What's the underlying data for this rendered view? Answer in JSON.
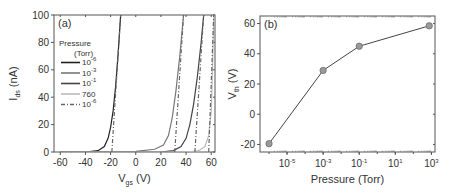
{
  "chart_data": [
    {
      "type": "line",
      "panel": "(a)",
      "xlabel": "V_gs (V)",
      "xlabel_main": "V",
      "xlabel_sub": "gs",
      "xlabel_unit": "(V)",
      "ylabel": "I_ds (nA)",
      "ylabel_main": "I",
      "ylabel_sub": "ds",
      "ylabel_unit": "(nA)",
      "xlim": [
        -65,
        63
      ],
      "ylim": [
        0,
        100
      ],
      "xticks": [
        "-60",
        "-40",
        "-20",
        "0",
        "20",
        "40",
        "60"
      ],
      "yticks": [
        "0",
        "20",
        "40",
        "60",
        "80",
        "100"
      ],
      "legend_title": [
        "Pressure",
        "(Torr)"
      ],
      "legend_position": "upper-left",
      "series": [
        {
          "name": "10^-6",
          "label_base": "10",
          "label_exp": "-6",
          "style": "solid",
          "color": "#222222",
          "x": [
            -60,
            -40,
            -30,
            -25,
            -22,
            -20,
            -18,
            -16,
            -14,
            -12
          ],
          "y": [
            0,
            0,
            1,
            4,
            10,
            18,
            30,
            48,
            72,
            100
          ]
        },
        {
          "name": "10^-3",
          "label_base": "10",
          "label_exp": "-3",
          "style": "solid",
          "color": "#777777",
          "x": [
            -60,
            0,
            15,
            22,
            26,
            29,
            32,
            35,
            38
          ],
          "y": [
            0,
            0.5,
            2,
            5,
            12,
            25,
            45,
            70,
            100
          ]
        },
        {
          "name": "10^-1",
          "label_base": "10",
          "label_exp": "-1",
          "style": "solid",
          "color": "#444444",
          "x": [
            -60,
            20,
            30,
            36,
            40,
            43,
            46,
            49,
            52,
            54
          ],
          "y": [
            0,
            0,
            1,
            4,
            10,
            20,
            35,
            55,
            80,
            100
          ]
        },
        {
          "name": "760",
          "label_base": "760",
          "label_exp": "",
          "style": "solid",
          "color": "#bbbbbb",
          "x": [
            -60,
            40,
            50,
            55,
            58,
            60,
            61,
            62
          ],
          "y": [
            0,
            0,
            1,
            4,
            12,
            30,
            60,
            100
          ]
        },
        {
          "name": "10^-6 (dashed fit)",
          "label_base": "10",
          "label_exp": "-6",
          "style": "dash-dot",
          "color": "#666666",
          "x": [
            -19,
            -12
          ],
          "y": [
            0,
            100
          ],
          "extra_fits": [
            {
              "x": [
                31,
                38
              ],
              "y": [
                0,
                100
              ]
            },
            {
              "x": [
                47,
                54
              ],
              "y": [
                0,
                100
              ]
            },
            {
              "x": [
                58,
                62
              ],
              "y": [
                0,
                100
              ]
            }
          ]
        }
      ],
      "grid": false
    },
    {
      "type": "line",
      "panel": "(b)",
      "xlabel": "Pressure (Torr)",
      "ylabel": "V_th (V)",
      "ylabel_main": "V",
      "ylabel_sub": "th",
      "ylabel_unit": "(V)",
      "xscale": "log",
      "xlim_exp": [
        -6.5,
        3.2
      ],
      "ylim": [
        -25,
        65
      ],
      "xticks": [
        {
          "base": "10",
          "exp": "-5"
        },
        {
          "base": "10",
          "exp": "-3"
        },
        {
          "base": "10",
          "exp": "-1"
        },
        {
          "base": "10",
          "exp": "1"
        },
        {
          "base": "10",
          "exp": "3"
        }
      ],
      "yticks": [
        "-20",
        "0",
        "20",
        "40",
        "60"
      ],
      "series": [
        {
          "name": "Vth",
          "marker": "circle",
          "color": "#444444",
          "marker_color": "#999999",
          "x_log10": [
            -6,
            -3,
            -1,
            2.88
          ],
          "x": [
            1e-06,
            0.001,
            0.1,
            760
          ],
          "y": [
            -19.5,
            29,
            45,
            58.5
          ]
        }
      ],
      "grid": false
    }
  ]
}
